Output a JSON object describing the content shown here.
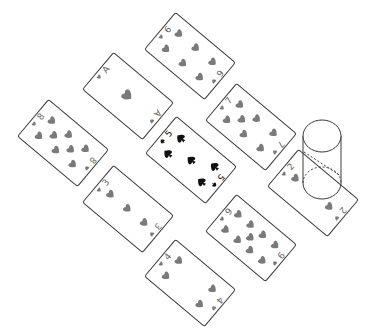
{
  "scene": {
    "description": "Isometric view of nine playing cards laid out in a 3x3 diamond grid with a transparent drinking glass standing on one card",
    "background": "#ffffff",
    "card_outline_color": "#3a3a3a",
    "heart_color": "#7a7a7a",
    "spade_color": "#111111"
  },
  "cards": [
    {
      "id": "card-6-hearts",
      "rank": "6",
      "suit": "hearts",
      "cx": 190,
      "cy": 56
    },
    {
      "id": "card-a-hearts",
      "rank": "A",
      "suit": "hearts",
      "cx": 128,
      "cy": 96
    },
    {
      "id": "card-7-hearts",
      "rank": "7",
      "suit": "hearts",
      "cx": 251,
      "cy": 127
    },
    {
      "id": "card-8-hearts",
      "rank": "8",
      "suit": "hearts",
      "cx": 63,
      "cy": 143
    },
    {
      "id": "card-5-spades",
      "rank": "5",
      "suit": "spades",
      "cx": 191,
      "cy": 160
    },
    {
      "id": "card-2-hearts",
      "rank": "2",
      "suit": "hearts",
      "cx": 313,
      "cy": 193
    },
    {
      "id": "card-3-hearts",
      "rank": "3",
      "suit": "hearts",
      "cx": 128,
      "cy": 209
    },
    {
      "id": "card-9-hearts",
      "rank": "9",
      "suit": "hearts",
      "cx": 251,
      "cy": 238
    },
    {
      "id": "card-4-hearts",
      "rank": "4",
      "suit": "hearts",
      "cx": 190,
      "cy": 283
    }
  ],
  "glass": {
    "on_card": "2",
    "outline_color": "#3a3a3a",
    "top_cx": 322,
    "top_cy": 136,
    "rx": 19,
    "ry": 16,
    "bottom_cx": 322,
    "bottom_cy": 183
  }
}
